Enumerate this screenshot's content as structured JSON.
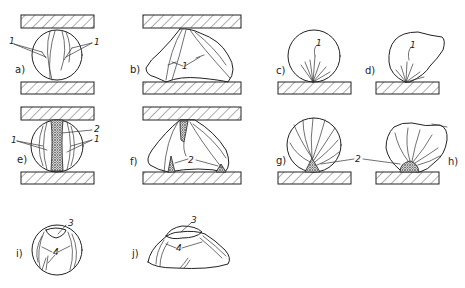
{
  "figure": {
    "panels": [
      {
        "id": "a",
        "label": "a)",
        "callouts": [
          "1",
          "1"
        ]
      },
      {
        "id": "b",
        "label": "b)",
        "callouts": [
          "1"
        ]
      },
      {
        "id": "c",
        "label": "c)",
        "callouts": [
          "1"
        ]
      },
      {
        "id": "d",
        "label": "d)",
        "callouts": [
          "1"
        ]
      },
      {
        "id": "e",
        "label": "e)",
        "callouts": [
          "1",
          "2",
          "1"
        ]
      },
      {
        "id": "f",
        "label": "f)",
        "callouts": [
          "2"
        ]
      },
      {
        "id": "g",
        "label": "g)",
        "callouts": [
          "2"
        ]
      },
      {
        "id": "h",
        "label": "h)",
        "callouts": []
      },
      {
        "id": "i",
        "label": "i)",
        "callouts": [
          "3",
          "4"
        ]
      },
      {
        "id": "j",
        "label": "j)",
        "callouts": [
          "3",
          "4"
        ]
      }
    ],
    "legend_numbers": {
      "n1": "1",
      "n2": "2",
      "n3": "3",
      "n4": "4"
    },
    "colors": {
      "ink": "#222222",
      "background": "#ffffff"
    }
  }
}
